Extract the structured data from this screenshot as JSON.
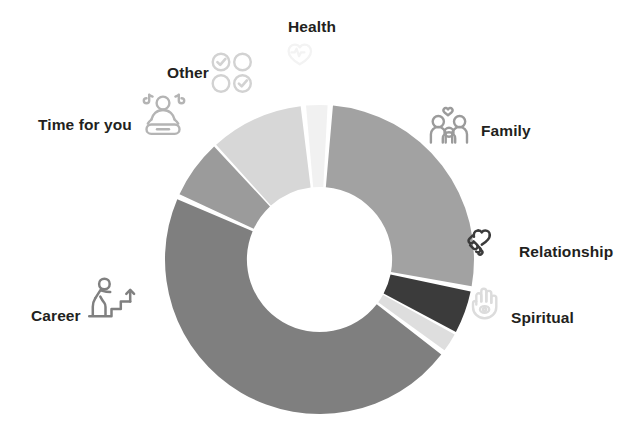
{
  "chart_data": {
    "type": "pie",
    "title": "",
    "subtitle": "",
    "xlabel": "",
    "ylabel": "",
    "legend_position": "around-chart",
    "grid": false,
    "donut": true,
    "inner_radius_ratio": 0.47,
    "start_angle_deg": -5,
    "direction": "clockwise",
    "categories": [
      "Health",
      "Family",
      "Relationship",
      "Spiritual",
      "Career",
      "Time for you",
      "Other"
    ],
    "values": [
      2,
      26,
      4.5,
      2,
      46,
      6,
      10
    ],
    "unit": "percent",
    "slices": [
      {
        "label": "Health",
        "value": 2,
        "color": "#f1f1f1",
        "start_angle_deg": -5,
        "end_angle_deg": 3,
        "icon": "heart-pulse-icon",
        "icon_color": "#f4f4f4",
        "label_anchor": "top"
      },
      {
        "label": "Family",
        "value": 26,
        "color": "#a2a2a2",
        "start_angle_deg": 5,
        "end_angle_deg": 100,
        "icon": "family-heart-icon",
        "icon_color": "#9a9a9a",
        "label_anchor": "top-right"
      },
      {
        "label": "Relationship",
        "value": 4.5,
        "color": "#3b3b3b",
        "start_angle_deg": 102,
        "end_angle_deg": 118,
        "icon": "handshake-heart-icon",
        "icon_color": "#3b3b3b",
        "label_anchor": "right"
      },
      {
        "label": "Spiritual",
        "value": 2,
        "color": "#dedede",
        "start_angle_deg": 119,
        "end_angle_deg": 126,
        "icon": "hamsa-hand-icon",
        "icon_color": "#dcdcdc",
        "label_anchor": "right-lower"
      },
      {
        "label": "Career",
        "value": 46,
        "color": "#7f7f7f",
        "start_angle_deg": 128,
        "end_angle_deg": 293,
        "icon": "person-climbing-stairs-icon",
        "icon_color": "#808080",
        "label_anchor": "left-lower"
      },
      {
        "label": "Time for you",
        "value": 6,
        "color": "#9b9b9b",
        "start_angle_deg": 295,
        "end_angle_deg": 317,
        "icon": "meditation-music-icon",
        "icon_color": "#b4b4b4",
        "label_anchor": "top-left"
      },
      {
        "label": "Other",
        "value": 10,
        "color": "#d7d7d7",
        "start_angle_deg": 318,
        "end_angle_deg": 353,
        "icon": "checklist-circles-icon",
        "icon_color": "#d2d2d2",
        "label_anchor": "top-left-upper"
      }
    ]
  },
  "labels": {
    "health": "Health",
    "family": "Family",
    "relationship": "Relationship",
    "spiritual": "Spiritual",
    "career": "Career",
    "time_for_you": "Time for you",
    "other": "Other"
  },
  "colors": {
    "background": "#ffffff",
    "text": "#231f20",
    "health": "#f1f1f1",
    "family": "#a2a2a2",
    "relationship": "#3b3b3b",
    "spiritual": "#dedede",
    "career": "#7f7f7f",
    "time_for_you": "#9b9b9b",
    "other": "#d7d7d7"
  }
}
